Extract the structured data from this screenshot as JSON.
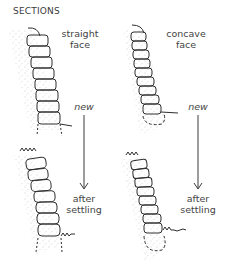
{
  "title": "SECTIONS",
  "panels": [
    {
      "id": "straight-new",
      "face_label": [
        "straight",
        "face"
      ],
      "state_label": "new"
    },
    {
      "id": "concave-new",
      "face_label": [
        "concave",
        "face"
      ],
      "state_label": "new"
    },
    {
      "id": "straight-settled",
      "state_label": [
        "after",
        "settling"
      ]
    },
    {
      "id": "concave-settled",
      "state_label": [
        "after",
        "settling"
      ]
    }
  ],
  "labels": {
    "straight_1": "straight",
    "straight_2": "face",
    "concave_1": "concave",
    "concave_2": "face",
    "new_left": "new",
    "new_right": "new",
    "after_left": "after",
    "settling_left": "settling",
    "after_right": "after",
    "settling_right": "settling"
  },
  "colors": {
    "ink": "#2e2e2e",
    "soil": "#9a9a9a",
    "text": "#444444"
  }
}
